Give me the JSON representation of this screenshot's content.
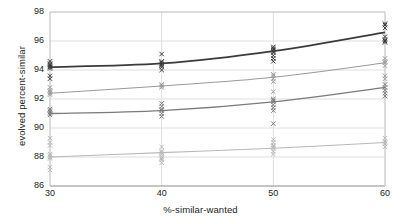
{
  "chart_data": {
    "type": "scatter",
    "title": "",
    "xlabel": "%-similar-wanted",
    "ylabel": "evolved percent-similar",
    "xlim": [
      30,
      60
    ],
    "ylim": [
      86,
      98
    ],
    "xticks": [
      30,
      40,
      50,
      60
    ],
    "yticks": [
      86,
      88,
      90,
      92,
      94,
      96,
      98
    ],
    "xtick_labels": [
      "30",
      "40",
      "50",
      "60"
    ],
    "ytick_labels": [
      "86",
      "88",
      "90",
      "92",
      "94",
      "96",
      "98"
    ],
    "grid": "horizontal-and-vertical-light",
    "legend": "none",
    "marker": "x",
    "x": [
      30,
      40,
      50,
      60
    ],
    "series": [
      {
        "name": "series-1-darkest",
        "color": "#3b3b3b",
        "width": 1.8,
        "values": [
          94.2,
          94.45,
          95.3,
          96.6
        ],
        "points": [
          [
            30,
            94.6
          ],
          [
            30,
            94.45
          ],
          [
            30,
            94.35
          ],
          [
            30,
            94.25
          ],
          [
            30,
            94.2
          ],
          [
            30,
            94.1
          ],
          [
            30,
            93.6
          ],
          [
            30,
            93.4
          ],
          [
            40,
            95.1
          ],
          [
            40,
            94.6
          ],
          [
            40,
            94.5
          ],
          [
            40,
            94.4
          ],
          [
            40,
            94.3
          ],
          [
            40,
            94.2
          ],
          [
            40,
            94.0
          ],
          [
            50,
            95.6
          ],
          [
            50,
            95.5
          ],
          [
            50,
            95.4
          ],
          [
            50,
            95.3
          ],
          [
            50,
            95.2
          ],
          [
            50,
            95.0
          ],
          [
            50,
            94.8
          ],
          [
            50,
            94.6
          ],
          [
            60,
            97.2
          ],
          [
            60,
            97.1
          ],
          [
            60,
            96.9
          ],
          [
            60,
            96.3
          ],
          [
            60,
            96.1
          ],
          [
            60,
            96.0
          ],
          [
            60,
            95.9
          ]
        ]
      },
      {
        "name": "series-2-medium-light",
        "color": "#9a9a9a",
        "width": 1.1,
        "values": [
          92.4,
          92.9,
          93.5,
          94.5
        ],
        "points": [
          [
            30,
            92.8
          ],
          [
            30,
            92.6
          ],
          [
            30,
            92.5
          ],
          [
            30,
            92.4
          ],
          [
            30,
            92.3
          ],
          [
            40,
            93.0
          ],
          [
            40,
            92.9
          ],
          [
            40,
            92.8
          ],
          [
            50,
            93.7
          ],
          [
            50,
            93.6
          ],
          [
            50,
            93.4
          ],
          [
            50,
            93.2
          ],
          [
            50,
            92.5
          ],
          [
            60,
            94.8
          ],
          [
            60,
            94.6
          ],
          [
            60,
            94.5
          ],
          [
            60,
            94.3
          ],
          [
            60,
            93.6
          ],
          [
            60,
            93.4
          ]
        ]
      },
      {
        "name": "series-3-medium-dark",
        "color": "#7a7a7a",
        "width": 1.4,
        "values": [
          91.0,
          91.2,
          91.8,
          92.8
        ],
        "points": [
          [
            30,
            91.3
          ],
          [
            30,
            91.2
          ],
          [
            30,
            91.1
          ],
          [
            30,
            91.0
          ],
          [
            30,
            90.9
          ],
          [
            40,
            91.7
          ],
          [
            40,
            91.5
          ],
          [
            40,
            91.3
          ],
          [
            40,
            91.2
          ],
          [
            40,
            91.0
          ],
          [
            40,
            90.8
          ],
          [
            50,
            92.0
          ],
          [
            50,
            91.9
          ],
          [
            50,
            91.8
          ],
          [
            50,
            91.6
          ],
          [
            50,
            91.4
          ],
          [
            50,
            91.2
          ],
          [
            50,
            90.3
          ],
          [
            60,
            93.0
          ],
          [
            60,
            92.8
          ],
          [
            60,
            92.6
          ],
          [
            60,
            92.4
          ],
          [
            60,
            92.2
          ]
        ]
      },
      {
        "name": "series-4-lightest",
        "color": "#b8b8b8",
        "width": 1.1,
        "values": [
          88.0,
          88.3,
          88.6,
          89.0
        ],
        "points": [
          [
            30,
            89.3
          ],
          [
            30,
            89.0
          ],
          [
            30,
            88.8
          ],
          [
            30,
            88.2
          ],
          [
            30,
            88.1
          ],
          [
            30,
            88.0
          ],
          [
            30,
            87.9
          ],
          [
            30,
            87.3
          ],
          [
            30,
            87.1
          ],
          [
            40,
            88.7
          ],
          [
            40,
            88.4
          ],
          [
            40,
            88.3
          ],
          [
            40,
            88.2
          ],
          [
            40,
            88.0
          ],
          [
            40,
            87.9
          ],
          [
            40,
            87.8
          ],
          [
            40,
            87.6
          ],
          [
            50,
            89.2
          ],
          [
            50,
            89.0
          ],
          [
            50,
            88.8
          ],
          [
            50,
            88.7
          ],
          [
            50,
            88.6
          ],
          [
            50,
            88.4
          ],
          [
            50,
            88.2
          ],
          [
            60,
            89.3
          ],
          [
            60,
            89.1
          ],
          [
            60,
            89.0
          ],
          [
            60,
            88.9
          ],
          [
            60,
            88.7
          ]
        ]
      }
    ]
  }
}
